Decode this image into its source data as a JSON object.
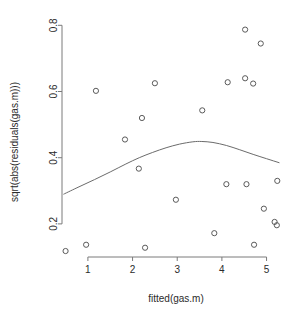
{
  "chart_data": {
    "type": "scatter",
    "title": "",
    "xlabel": "fitted(gas.m)",
    "ylabel": "sqrt(abs(residuals(gas.m)))",
    "xlim": [
      0.42,
      5.48
    ],
    "ylim": [
      0.1,
      0.81
    ],
    "xticks": [
      1,
      2,
      3,
      4,
      5
    ],
    "xtick_labels": [
      "1",
      "2",
      "3",
      "4",
      "5"
    ],
    "yticks": [
      0.2,
      0.4,
      0.6,
      0.8
    ],
    "ytick_labels": [
      "0.2",
      "0.4",
      "0.6",
      "0.8"
    ],
    "grid": false,
    "legend": null,
    "point_marker": "open-circle",
    "point_color": "#5a5a5a",
    "smoother_color": "#6b6b6b",
    "points": [
      {
        "x": 0.5,
        "y": 0.118
      },
      {
        "x": 0.96,
        "y": 0.137
      },
      {
        "x": 1.18,
        "y": 0.602
      },
      {
        "x": 1.83,
        "y": 0.455
      },
      {
        "x": 2.14,
        "y": 0.367
      },
      {
        "x": 2.28,
        "y": 0.128
      },
      {
        "x": 2.21,
        "y": 0.52
      },
      {
        "x": 2.5,
        "y": 0.625
      },
      {
        "x": 2.97,
        "y": 0.273
      },
      {
        "x": 3.56,
        "y": 0.543
      },
      {
        "x": 3.83,
        "y": 0.172
      },
      {
        "x": 4.1,
        "y": 0.32
      },
      {
        "x": 4.13,
        "y": 0.628
      },
      {
        "x": 4.52,
        "y": 0.64
      },
      {
        "x": 4.52,
        "y": 0.787
      },
      {
        "x": 4.55,
        "y": 0.32
      },
      {
        "x": 4.7,
        "y": 0.624
      },
      {
        "x": 4.72,
        "y": 0.137
      },
      {
        "x": 4.87,
        "y": 0.745
      },
      {
        "x": 4.94,
        "y": 0.246
      },
      {
        "x": 5.18,
        "y": 0.206
      },
      {
        "x": 5.23,
        "y": 0.196
      },
      {
        "x": 5.24,
        "y": 0.33
      }
    ],
    "smoother": [
      {
        "x": 0.46,
        "y": 0.29
      },
      {
        "x": 0.8,
        "y": 0.312
      },
      {
        "x": 1.15,
        "y": 0.334
      },
      {
        "x": 1.5,
        "y": 0.357
      },
      {
        "x": 1.85,
        "y": 0.381
      },
      {
        "x": 2.15,
        "y": 0.4
      },
      {
        "x": 2.45,
        "y": 0.416
      },
      {
        "x": 2.75,
        "y": 0.43
      },
      {
        "x": 3.05,
        "y": 0.441
      },
      {
        "x": 3.35,
        "y": 0.448
      },
      {
        "x": 3.55,
        "y": 0.449
      },
      {
        "x": 3.8,
        "y": 0.446
      },
      {
        "x": 4.1,
        "y": 0.437
      },
      {
        "x": 4.4,
        "y": 0.424
      },
      {
        "x": 4.7,
        "y": 0.41
      },
      {
        "x": 5.0,
        "y": 0.397
      },
      {
        "x": 5.28,
        "y": 0.385
      }
    ]
  }
}
